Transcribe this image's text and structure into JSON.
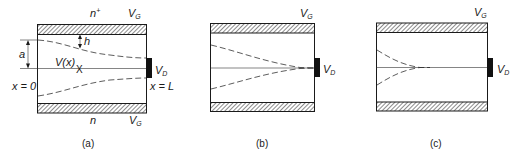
{
  "figure": {
    "panels": [
      {
        "id": "a",
        "caption": "(a)",
        "labels": {
          "top_region": "n",
          "top_region_sup": "+",
          "top_gate": "V",
          "top_gate_sub": "G",
          "bottom_region": "n",
          "bottom_gate": "V",
          "bottom_gate_sub": "G",
          "drain": "V",
          "drain_sub": "D",
          "source_pos": "x = 0",
          "drain_pos": "x = L",
          "half_width": "a",
          "depletion_depth": "h",
          "potential": "V(x)",
          "marker": "X"
        }
      },
      {
        "id": "b",
        "caption": "(b)",
        "labels": {
          "top_gate": "V",
          "top_gate_sub": "G",
          "drain": "V",
          "drain_sub": "D"
        }
      },
      {
        "id": "c",
        "caption": "(c)",
        "labels": {
          "top_gate": "V",
          "top_gate_sub": "G",
          "drain": "V",
          "drain_sub": "D"
        }
      }
    ]
  }
}
